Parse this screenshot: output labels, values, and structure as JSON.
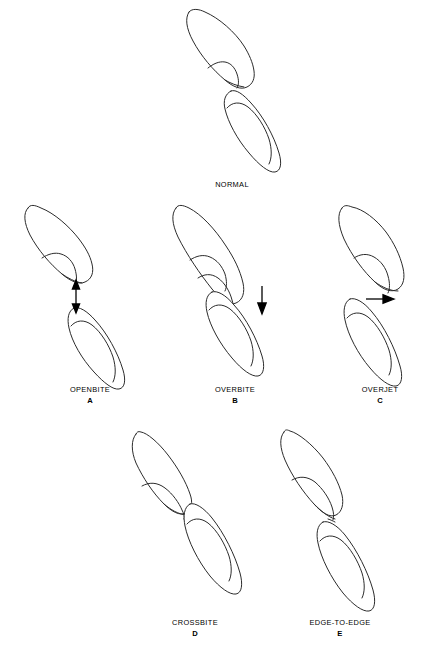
{
  "figure": {
    "title_visible": false,
    "background_color": "#ffffff",
    "ink_color": "#2b2b2b",
    "arrow_color": "#000000",
    "width": 432,
    "height": 660
  },
  "panels": [
    {
      "id": "normal",
      "label": "NORMAL",
      "letter": "",
      "arrow": "none",
      "arrow_direction": "",
      "x": 175,
      "y": 8,
      "caption_x": 152,
      "caption_y": 180
    },
    {
      "id": "openbite",
      "label": "OPENBITE",
      "letter": "A",
      "arrow": "double-vertical",
      "arrow_direction": "up-down",
      "x": 12,
      "y": 204,
      "caption_x": 10,
      "caption_y": 389
    },
    {
      "id": "overbite",
      "label": "OVERBITE",
      "letter": "B",
      "arrow": "single-down",
      "arrow_direction": "down",
      "x": 160,
      "y": 204,
      "caption_x": 155,
      "caption_y": 389
    },
    {
      "id": "overjet",
      "label": "OVERJET",
      "letter": "C",
      "arrow": "single-right",
      "arrow_direction": "right",
      "x": 320,
      "y": 204,
      "caption_x": 300,
      "caption_y": 389
    },
    {
      "id": "crossbite",
      "label": "CROSSBITE",
      "letter": "D",
      "arrow": "none",
      "arrow_direction": "",
      "x": 120,
      "y": 428,
      "caption_x": 115,
      "caption_y": 618
    },
    {
      "id": "edge-to-edge",
      "label": "EDGE-TO-EDGE",
      "letter": "E",
      "arrow": "none",
      "arrow_direction": "",
      "x": 268,
      "y": 428,
      "caption_x": 260,
      "caption_y": 618
    }
  ],
  "legend": {
    "subject": "dental occlusion relationships of maxillary and mandibular incisors",
    "upper_tooth_name": "maxillary incisor",
    "lower_tooth_name": "mandibular incisor"
  }
}
